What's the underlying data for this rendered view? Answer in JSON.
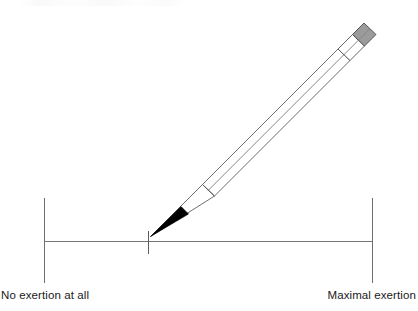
{
  "figure": {
    "background_color": "#ffffff",
    "width": 418,
    "height": 311
  },
  "scale": {
    "name": "visual-analogue-scale",
    "line_color": "#6e6e6e",
    "anchor_color": "#6e6e6e",
    "left_anchor": {
      "label": "No exertion at all",
      "x": 44.5,
      "y_top": 198,
      "y_bottom": 283
    },
    "right_anchor": {
      "label": "Maximal exertion",
      "x": 372.5,
      "y_top": 198,
      "y_bottom": 283
    },
    "baseline": {
      "x1": 44.5,
      "x2": 372.5,
      "y": 241.5
    },
    "rating_mark": {
      "label": "",
      "x": 148.5,
      "y_top": 230,
      "y_bottom": 253,
      "value_fraction": 0.317
    }
  },
  "pencil": {
    "name": "pencil",
    "outline_color": "#5a5a5a",
    "body_color": "#ffffff",
    "eraser_color": "#9b9b9b",
    "eraser_outline_color": "#555555",
    "ferrule_color": "#ffffff",
    "tip_color": "#000000",
    "angle_degrees": 36
  },
  "labels": {
    "left": "No exertion at all",
    "right": "Maximal exertion"
  }
}
